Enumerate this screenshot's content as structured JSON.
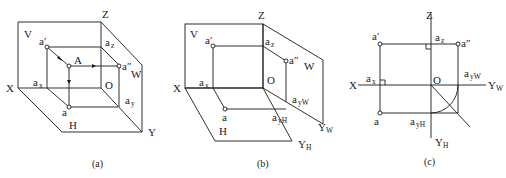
{
  "panels": [
    {
      "id": "a",
      "caption": "(a)",
      "labels": {
        "V": "V",
        "Z": "Z",
        "X": "X",
        "W": "W",
        "H": "H",
        "Y": "Y",
        "O": "O",
        "A": "A",
        "a_prime": "a′",
        "a_dprime": "a″",
        "a": "a",
        "a_x_base": "a",
        "a_x_sub": "x",
        "a_z_base": "a",
        "a_z_sub": "z",
        "a_y_base": "a",
        "a_y_sub": "y"
      }
    },
    {
      "id": "b",
      "caption": "(b)",
      "labels": {
        "V": "V",
        "Z": "Z",
        "X": "X",
        "W": "W",
        "H": "H",
        "O": "O",
        "a_prime": "a′",
        "a_dprime": "a″",
        "a": "a",
        "a_x_base": "a",
        "a_x_sub": "x",
        "a_z_base": "a",
        "a_z_sub": "z",
        "a_yW_base": "a",
        "a_yW_sub": "yW",
        "a_yH_base": "a",
        "a_yH_sub": "yH",
        "Y_W_base": "Y",
        "Y_W_sub": "W",
        "Y_H_base": "Y",
        "Y_H_sub": "H"
      }
    },
    {
      "id": "c",
      "caption": "(c)",
      "labels": {
        "Z": "Z",
        "X": "X",
        "O": "O",
        "a_prime": "a′",
        "a_dprime": "a″",
        "a": "a",
        "a_x_base": "a",
        "a_x_sub": "x",
        "a_z_base": "a",
        "a_z_sub": "z",
        "a_yW_base": "a",
        "a_yW_sub": "yW",
        "a_yH_base": "a",
        "a_yH_sub": "yH",
        "Y_W_base": "Y",
        "Y_W_sub": "W",
        "Y_H_base": "Y",
        "Y_H_sub": "H"
      }
    }
  ]
}
